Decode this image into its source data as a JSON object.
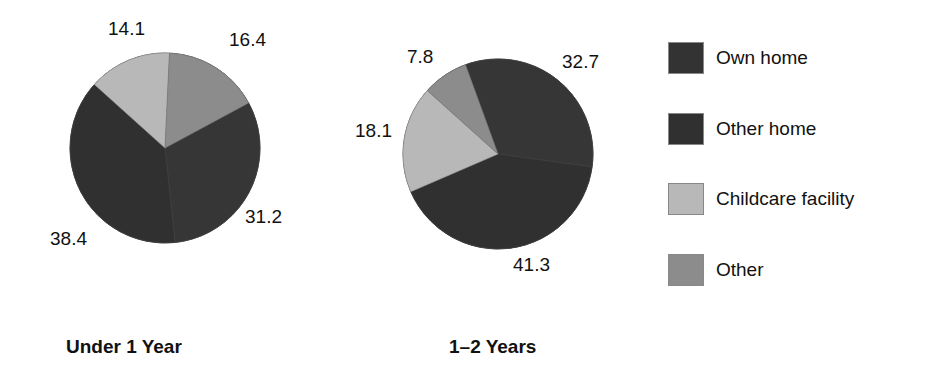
{
  "chart_data": [
    {
      "type": "pie",
      "title": "Under 1 Year",
      "categories": [
        "Own home",
        "Other home",
        "Childcare facility",
        "Other"
      ],
      "values": [
        31.2,
        38.4,
        14.1,
        16.4
      ],
      "value_labels": [
        "31.2",
        "38.4",
        "14.1",
        "16.4"
      ],
      "start_angle_deg": 312,
      "slice_order_clockwise": [
        "Childcare facility",
        "Other",
        "Own home",
        "Other home"
      ]
    },
    {
      "type": "pie",
      "title": "1–2 Years",
      "categories": [
        "Own home",
        "Other home",
        "Childcare facility",
        "Other"
      ],
      "values": [
        32.7,
        41.3,
        18.1,
        7.8
      ],
      "value_labels": [
        "32.7",
        "41.3",
        "18.1",
        "7.8"
      ],
      "start_angle_deg": 340,
      "slice_order_clockwise": [
        "Own home",
        "Other home",
        "Childcare facility",
        "Other"
      ]
    }
  ],
  "legend": {
    "position": "right",
    "items": [
      {
        "label": "Own home",
        "color": "#333333"
      },
      {
        "label": "Other home",
        "color": "#303030"
      },
      {
        "label": "Childcare facility",
        "color": "#b8b8b8"
      },
      {
        "label": "Other",
        "color": "#8c8c8c"
      }
    ]
  },
  "titles": {
    "pie1": "Under 1 Year",
    "pie2": "1–2 Years"
  },
  "labels": {
    "pie1": {
      "own_home": "31.2",
      "other_home": "38.4",
      "childcare": "14.1",
      "other": "16.4"
    },
    "pie2": {
      "own_home": "32.7",
      "other_home": "41.3",
      "childcare": "18.1",
      "other": "7.8"
    }
  }
}
